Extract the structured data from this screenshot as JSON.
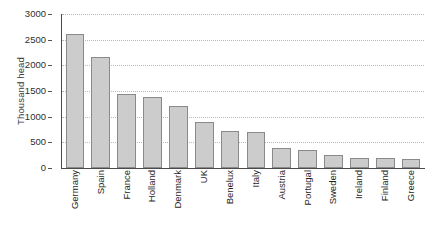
{
  "chart_data": {
    "type": "bar",
    "title": "",
    "xlabel": "",
    "ylabel": "Thousand head",
    "ylim": [
      0,
      3000
    ],
    "yticks": [
      0,
      500,
      1000,
      1500,
      2000,
      2500,
      3000
    ],
    "ytick_labels": [
      "0",
      "500",
      "1000",
      "1500",
      "2000",
      "2500",
      "3000"
    ],
    "grid": "horizontal-dotted",
    "legend": "none",
    "bar_fill_color": "#cccccc",
    "bar_border_color": "#8a8a8a",
    "gridline_color": "#b9b9b9",
    "axis_color": "#4a4a4a",
    "background_color": "#ffffff",
    "categories": [
      "Germany",
      "Spain",
      "France",
      "Holland",
      "Denmark",
      "UK",
      "Benelux",
      "Italy",
      "Austria",
      "Portugal",
      "Sweden",
      "Ireland",
      "Finland",
      "Greece"
    ],
    "values": [
      2620,
      2160,
      1440,
      1380,
      1210,
      900,
      720,
      700,
      390,
      350,
      255,
      200,
      200,
      170
    ]
  }
}
